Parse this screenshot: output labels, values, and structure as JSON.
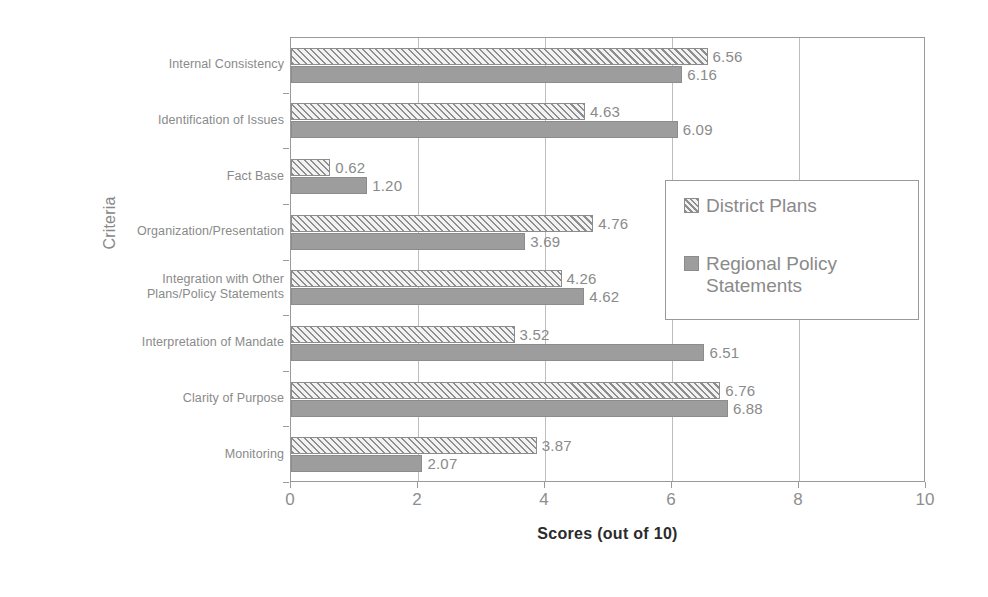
{
  "chart_data": {
    "type": "bar",
    "orientation": "horizontal",
    "title": "",
    "xlabel": "Scores (out of 10)",
    "ylabel": "Criteria",
    "xlim": [
      0,
      10
    ],
    "xticks": [
      0,
      2,
      4,
      6,
      8,
      10
    ],
    "xtick_labels": [
      "0",
      "2",
      "4",
      "6",
      "8",
      "10"
    ],
    "grid": "vertical",
    "legend_position": "center-right",
    "categories": [
      "Internal Consistency",
      "Identification of Issues",
      "Fact Base",
      "Organization/Presentation",
      "Integration with Other Plans/Policy Statements",
      "Interpretation of Mandate",
      "Clarity of Purpose",
      "Monitoring"
    ],
    "category_lines": [
      [
        "Internal Consistency"
      ],
      [
        "Identification of Issues"
      ],
      [
        "Fact Base"
      ],
      [
        "Organization/Presentation"
      ],
      [
        "Integration with Other",
        "Plans/Policy Statements"
      ],
      [
        "Interpretation of Mandate"
      ],
      [
        "Clarity of Purpose"
      ],
      [
        "Monitoring"
      ]
    ],
    "series": [
      {
        "name": "District Plans",
        "pattern": "diagonal-hatch",
        "color": "#d8d8d8",
        "values": [
          6.56,
          4.63,
          0.62,
          4.76,
          4.26,
          3.52,
          6.76,
          3.87
        ],
        "value_labels": [
          "6.56",
          "4.63",
          "0.62",
          "4.76",
          "4.26",
          "3.52",
          "6.76",
          "3.87"
        ]
      },
      {
        "name": "Regional Policy Statements",
        "pattern": "solid",
        "color": "#9d9d9d",
        "values": [
          6.16,
          6.09,
          1.2,
          3.69,
          4.62,
          6.51,
          6.88,
          2.07
        ],
        "value_labels": [
          "6.16",
          "6.09",
          "1.20",
          "3.69",
          "4.62",
          "6.51",
          "6.88",
          "2.07"
        ]
      }
    ],
    "legend_entries": [
      {
        "label": "District Plans",
        "lines": [
          "District Plans"
        ]
      },
      {
        "label": "Regional Policy Statements",
        "lines": [
          "Regional Policy",
          "Statements"
        ]
      }
    ]
  }
}
